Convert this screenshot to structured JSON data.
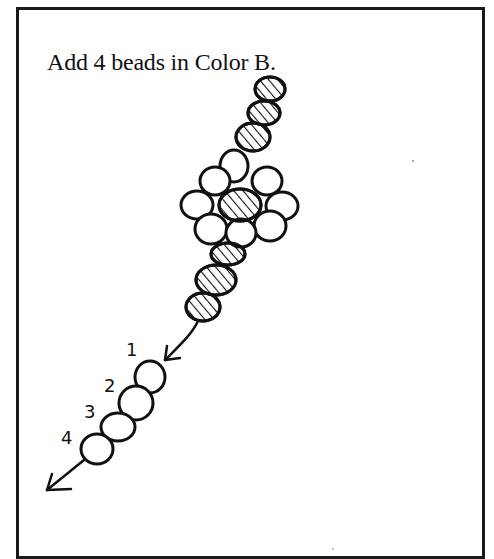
{
  "page": {
    "instruction": "Add 4 beads in Color B."
  },
  "diagram": {
    "legend": {
      "hatched": "Color A bead",
      "open": "Color B bead"
    },
    "new_bead_labels": [
      "1",
      "2",
      "3",
      "4"
    ],
    "colors": {
      "ink": "#111111",
      "paper": "#ffffff"
    }
  }
}
